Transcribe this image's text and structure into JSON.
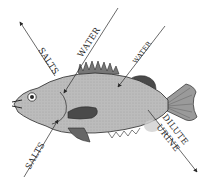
{
  "diagram": {
    "labels": {
      "salts_out": "SALTS",
      "water_in_gills": "WATER",
      "water_in_body": "WATER",
      "salts_in": "SALTS",
      "urine_line1": "DILUTE",
      "urine_line2": "URINE"
    },
    "colors": {
      "body": "#b5b5b5",
      "outline": "#2a2a2a",
      "fin": "#5a5a5a",
      "bladder": "#c8c8c8"
    }
  }
}
